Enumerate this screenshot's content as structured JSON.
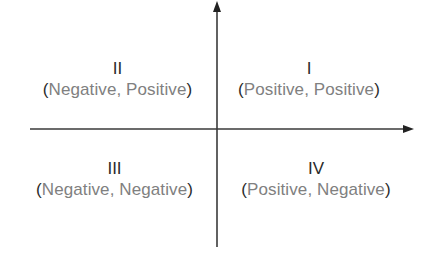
{
  "diagram": {
    "type": "cartesian-quadrants",
    "axes": {
      "x_axis": {
        "direction": "right",
        "arrow": true
      },
      "y_axis": {
        "direction": "up",
        "arrow": true
      }
    },
    "colors": {
      "axis": "#333333",
      "numeral": "#2a2a2a",
      "sign_words": "#808080",
      "parentheses": "#2a2a2a",
      "background": "#ffffff"
    },
    "quadrants": {
      "q1": {
        "numeral": "I",
        "open": "(",
        "x_sign": "Positive",
        "sep": ", ",
        "y_sign": "Positive",
        "close": ")"
      },
      "q2": {
        "numeral": "II",
        "open": "(",
        "x_sign": "Negative",
        "sep": ", ",
        "y_sign": "Positive",
        "close": ")"
      },
      "q3": {
        "numeral": "III",
        "open": "(",
        "x_sign": "Negative",
        "sep": ", ",
        "y_sign": "Negative",
        "close": ")"
      },
      "q4": {
        "numeral": "IV",
        "open": "(",
        "x_sign": "Positive",
        "sep": ", ",
        "y_sign": "Negative",
        "close": ")"
      }
    }
  }
}
